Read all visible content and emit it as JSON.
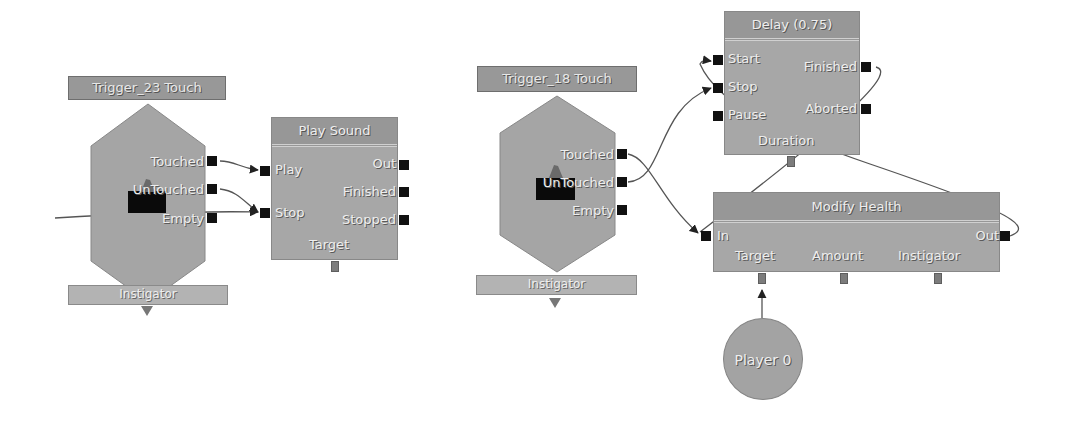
{
  "diagram": {
    "left_sequence": {
      "trigger": {
        "title": "Trigger_23 Touch",
        "outputs": [
          "Touched",
          "UnTouched",
          "Empty"
        ],
        "variable_bar": "Instigator"
      },
      "play_sound": {
        "title": "Play Sound",
        "inputs": [
          "Play",
          "Stop"
        ],
        "outputs": [
          "Out",
          "Finished",
          "Stopped"
        ],
        "variables": [
          "Target"
        ]
      }
    },
    "right_sequence": {
      "trigger": {
        "title": "Trigger_18 Touch",
        "outputs": [
          "Touched",
          "UnTouched",
          "Empty"
        ],
        "variable_bar": "Instigator"
      },
      "delay": {
        "title": "Delay (0.75)",
        "inputs": [
          "Start",
          "Stop",
          "Pause"
        ],
        "outputs": [
          "Finished",
          "Aborted"
        ],
        "variables": [
          "Duration"
        ]
      },
      "modify_health": {
        "title": "Modify Health",
        "inputs": [
          "In"
        ],
        "outputs": [
          "Out"
        ],
        "variables": [
          "Target",
          "Amount",
          "Instigator"
        ]
      },
      "player_var": {
        "label": "Player 0"
      }
    },
    "connections": [
      {
        "from": "Trigger_23 Touch.Touched",
        "to": "Play Sound.Play"
      },
      {
        "from": "Trigger_23 Touch.UnTouched",
        "to": "Play Sound.Stop"
      },
      {
        "from": "external (off-left)",
        "to": "Play Sound.Stop"
      },
      {
        "from": "Trigger_18 Touch.Touched",
        "to": "Modify Health.In"
      },
      {
        "from": "Trigger_18 Touch.UnTouched",
        "to": "Delay (0.75).Stop"
      },
      {
        "from": "Delay (0.75).Finished",
        "to": "Modify Health.In"
      },
      {
        "from": "Modify Health.Out",
        "to": "Delay (0.75).Start"
      },
      {
        "from": "Player 0",
        "to": "Modify Health.Target"
      }
    ],
    "colors": {
      "node_fill": "#a7a7a7",
      "title_fill": "#979797",
      "port": "#111111",
      "wire": "#4a4a4a",
      "text": "#eeeeee"
    }
  }
}
